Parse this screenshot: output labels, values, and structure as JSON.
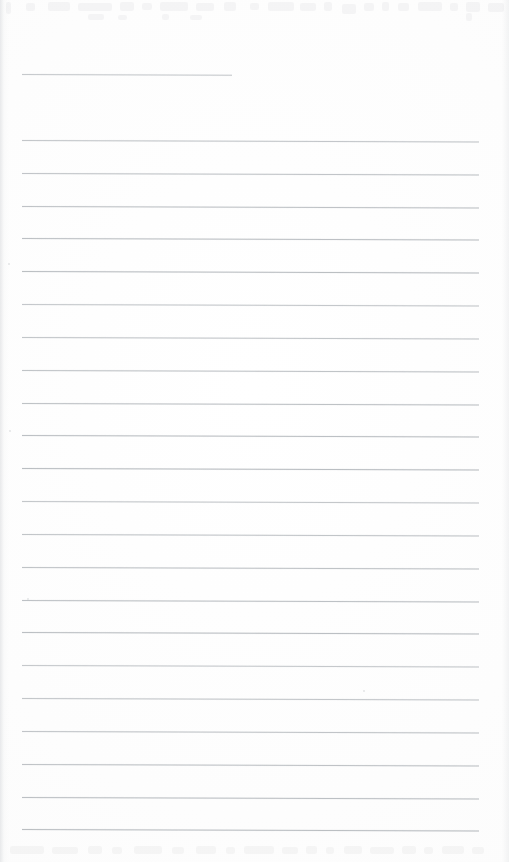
{
  "document": {
    "kind": "scanned-lined-paper",
    "title": "Blank Ruled Notebook Page",
    "width": 509,
    "height": 862,
    "paper_color": "#fdfdfd",
    "rule_color": "#b9bdc1",
    "rule_thickness_px": 1,
    "rule_skew_deg": 0.18,
    "body_text": "",
    "visible_text": "none"
  },
  "layout": {
    "rule_left_x": 22,
    "rule_right_x": 479,
    "full_rule_width": 457,
    "first_full_rule_y": 140,
    "rule_spacing_px": 32.8,
    "full_rule_count": 22
  },
  "header_rule": {
    "label": "header-underline",
    "x": 22,
    "y": 74,
    "width": 210,
    "right_x": 232,
    "note": "short rule near top, shorter than the body rules"
  },
  "rules": [
    {
      "index": 1,
      "y": 140,
      "x": 22,
      "width": 457
    },
    {
      "index": 2,
      "y": 173,
      "x": 22,
      "width": 457
    },
    {
      "index": 3,
      "y": 206,
      "x": 22,
      "width": 457
    },
    {
      "index": 4,
      "y": 238,
      "x": 22,
      "width": 457
    },
    {
      "index": 5,
      "y": 271,
      "x": 22,
      "width": 457
    },
    {
      "index": 6,
      "y": 304,
      "x": 22,
      "width": 457
    },
    {
      "index": 7,
      "y": 337,
      "x": 22,
      "width": 457
    },
    {
      "index": 8,
      "y": 370,
      "x": 22,
      "width": 457
    },
    {
      "index": 9,
      "y": 403,
      "x": 22,
      "width": 457
    },
    {
      "index": 10,
      "y": 435,
      "x": 22,
      "width": 457
    },
    {
      "index": 11,
      "y": 468,
      "x": 22,
      "width": 457
    },
    {
      "index": 12,
      "y": 501,
      "x": 22,
      "width": 457
    },
    {
      "index": 13,
      "y": 534,
      "x": 22,
      "width": 457
    },
    {
      "index": 14,
      "y": 567,
      "x": 22,
      "width": 457
    },
    {
      "index": 15,
      "y": 600,
      "x": 22,
      "width": 457
    },
    {
      "index": 16,
      "y": 632,
      "x": 22,
      "width": 457
    },
    {
      "index": 17,
      "y": 665,
      "x": 22,
      "width": 457
    },
    {
      "index": 18,
      "y": 698,
      "x": 22,
      "width": 457
    },
    {
      "index": 19,
      "y": 731,
      "x": 22,
      "width": 457
    },
    {
      "index": 20,
      "y": 764,
      "x": 22,
      "width": 457
    },
    {
      "index": 21,
      "y": 797,
      "x": 22,
      "width": 457
    },
    {
      "index": 22,
      "y": 829,
      "x": 22,
      "width": 457
    }
  ],
  "artifacts": {
    "top_ghost": {
      "label": "scan-bleedthrough-top",
      "description": "illegible faint ghost text bleed-through along the top edge",
      "y": 0,
      "height": 22,
      "smudges": [
        {
          "x": 6,
          "y": 2,
          "w": 5,
          "h": 12
        },
        {
          "x": 26,
          "y": 3,
          "w": 9,
          "h": 8
        },
        {
          "x": 48,
          "y": 2,
          "w": 22,
          "h": 9
        },
        {
          "x": 78,
          "y": 3,
          "w": 34,
          "h": 8
        },
        {
          "x": 120,
          "y": 2,
          "w": 14,
          "h": 9
        },
        {
          "x": 142,
          "y": 3,
          "w": 10,
          "h": 7
        },
        {
          "x": 160,
          "y": 2,
          "w": 28,
          "h": 9
        },
        {
          "x": 196,
          "y": 3,
          "w": 18,
          "h": 8
        },
        {
          "x": 224,
          "y": 2,
          "w": 12,
          "h": 9
        },
        {
          "x": 250,
          "y": 3,
          "w": 9,
          "h": 7
        },
        {
          "x": 268,
          "y": 2,
          "w": 26,
          "h": 9
        },
        {
          "x": 300,
          "y": 3,
          "w": 16,
          "h": 8
        },
        {
          "x": 324,
          "y": 2,
          "w": 8,
          "h": 9
        },
        {
          "x": 342,
          "y": 4,
          "w": 14,
          "h": 10
        },
        {
          "x": 364,
          "y": 3,
          "w": 10,
          "h": 8
        },
        {
          "x": 382,
          "y": 2,
          "w": 7,
          "h": 9
        },
        {
          "x": 398,
          "y": 3,
          "w": 11,
          "h": 8
        },
        {
          "x": 418,
          "y": 2,
          "w": 24,
          "h": 9
        },
        {
          "x": 450,
          "y": 3,
          "w": 8,
          "h": 8
        },
        {
          "x": 466,
          "y": 2,
          "w": 14,
          "h": 10
        },
        {
          "x": 488,
          "y": 3,
          "w": 16,
          "h": 9
        },
        {
          "x": 88,
          "y": 14,
          "w": 16,
          "h": 6
        },
        {
          "x": 118,
          "y": 15,
          "w": 9,
          "h": 5
        },
        {
          "x": 162,
          "y": 14,
          "w": 7,
          "h": 6
        },
        {
          "x": 190,
          "y": 15,
          "w": 12,
          "h": 5
        },
        {
          "x": 466,
          "y": 13,
          "w": 6,
          "h": 8
        }
      ]
    },
    "bottom_ghost": {
      "label": "scan-bleedthrough-bottom",
      "description": "illegible faint ghost text bleed-through along the bottom edge",
      "y": 842,
      "height": 20,
      "smudges": [
        {
          "x": 10,
          "y": 4,
          "w": 34,
          "h": 8
        },
        {
          "x": 52,
          "y": 5,
          "w": 26,
          "h": 7
        },
        {
          "x": 88,
          "y": 4,
          "w": 14,
          "h": 8
        },
        {
          "x": 112,
          "y": 5,
          "w": 10,
          "h": 7
        },
        {
          "x": 134,
          "y": 4,
          "w": 28,
          "h": 8
        },
        {
          "x": 172,
          "y": 5,
          "w": 12,
          "h": 7
        },
        {
          "x": 196,
          "y": 4,
          "w": 20,
          "h": 8
        },
        {
          "x": 226,
          "y": 5,
          "w": 9,
          "h": 7
        },
        {
          "x": 244,
          "y": 4,
          "w": 30,
          "h": 8
        },
        {
          "x": 282,
          "y": 5,
          "w": 16,
          "h": 7
        },
        {
          "x": 306,
          "y": 4,
          "w": 11,
          "h": 8
        },
        {
          "x": 326,
          "y": 5,
          "w": 8,
          "h": 7
        },
        {
          "x": 344,
          "y": 4,
          "w": 18,
          "h": 8
        },
        {
          "x": 370,
          "y": 5,
          "w": 24,
          "h": 7
        },
        {
          "x": 402,
          "y": 4,
          "w": 14,
          "h": 8
        },
        {
          "x": 424,
          "y": 5,
          "w": 9,
          "h": 7
        },
        {
          "x": 442,
          "y": 4,
          "w": 22,
          "h": 8
        },
        {
          "x": 472,
          "y": 5,
          "w": 12,
          "h": 7
        }
      ]
    },
    "specks": [
      {
        "x": 27,
        "y": 598,
        "d": 2
      },
      {
        "x": 363,
        "y": 690,
        "d": 2
      },
      {
        "x": 8,
        "y": 263,
        "d": 2
      },
      {
        "x": 9,
        "y": 430,
        "d": 2
      }
    ]
  }
}
